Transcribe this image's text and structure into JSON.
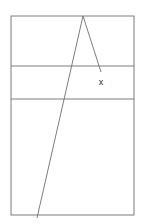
{
  "figure": {
    "background_color": "#ffffff",
    "stroke_color": "#6e6e6e",
    "label_color": "#2b2b2b",
    "stroke_width": 0.9,
    "canvas": {
      "width": 142,
      "height": 224
    },
    "rectangle": {
      "name": "outer-rectangle",
      "x": 11,
      "y": 16,
      "width": 123,
      "height": 199,
      "left": 11,
      "top": 16,
      "right": 134,
      "bottom": 215
    },
    "horizontal_dividers": [
      {
        "name": "divider-upper",
        "y": 66,
        "x1": 11,
        "x2": 134
      },
      {
        "name": "divider-lower",
        "y": 99,
        "x1": 11,
        "x2": 134
      }
    ],
    "bands": [
      {
        "name": "band-top",
        "top": 16,
        "bottom": 66,
        "height": 50
      },
      {
        "name": "band-middle",
        "top": 66,
        "bottom": 99,
        "height": 33
      },
      {
        "name": "band-bottom",
        "top": 99,
        "bottom": 215,
        "height": 116
      }
    ],
    "apex": {
      "name": "apex-point",
      "x": 83,
      "y": 16
    },
    "lines": [
      {
        "name": "long-diagonal-line",
        "x1": 83,
        "y1": 16,
        "x2": 37,
        "y2": 218,
        "crossings": [
          {
            "divider": "divider-upper",
            "x": 71,
            "y": 66
          },
          {
            "divider": "divider-lower",
            "x": 63,
            "y": 99
          },
          {
            "divider": "rectangle-bottom",
            "x": 38,
            "y": 215
          }
        ]
      },
      {
        "name": "short-diagonal-line",
        "x1": 83,
        "y1": 16,
        "x2": 101,
        "y2": 72,
        "crossings": [
          {
            "divider": "divider-upper",
            "x": 98,
            "y": 66
          }
        ]
      }
    ],
    "labels": [
      {
        "name": "label-x",
        "text": "x",
        "x": 101,
        "y": 85,
        "anchor": "middle",
        "font_size": 9
      }
    ]
  }
}
